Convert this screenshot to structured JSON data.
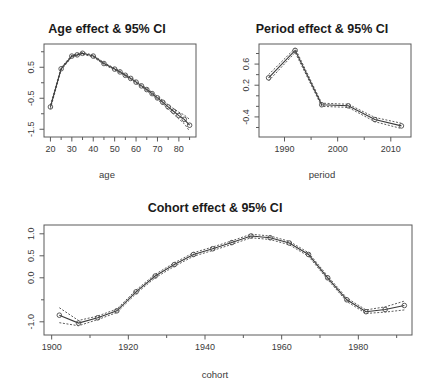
{
  "chart_data": [
    {
      "id": "age",
      "type": "line",
      "title": "Age effect & 95% CI",
      "xlabel": "age",
      "ylabel": "",
      "xlim": [
        17,
        88
      ],
      "ylim": [
        -1.75,
        1.25
      ],
      "xticks": [
        20,
        30,
        40,
        50,
        60,
        70,
        80
      ],
      "xticklabels": [
        "20",
        "30",
        "40",
        "50",
        "60",
        "70",
        "80"
      ],
      "xminorticks": [
        25,
        35,
        45,
        55,
        65,
        75,
        85
      ],
      "yticks": [
        -1.5,
        -0.5,
        0.5
      ],
      "yticklabels": [
        "-1.5",
        "-0.5",
        "0.5"
      ],
      "yminorticks": [
        -1.0,
        0.0,
        1.0
      ],
      "grid": false,
      "legend": null,
      "x": [
        20,
        25,
        30,
        32.5,
        35,
        40,
        45,
        50,
        52.5,
        55,
        57.5,
        60,
        62.5,
        65,
        67.5,
        70,
        72.5,
        75,
        77.5,
        80,
        82.5,
        85
      ],
      "series": [
        {
          "name": "estimate",
          "values": [
            -0.78,
            0.45,
            0.86,
            0.9,
            0.95,
            0.86,
            0.62,
            0.44,
            0.35,
            0.24,
            0.14,
            0.02,
            -0.1,
            -0.22,
            -0.35,
            -0.49,
            -0.63,
            -0.78,
            -0.92,
            -1.06,
            -1.18,
            -1.37
          ]
        },
        {
          "name": "ci_lower",
          "values": [
            -0.84,
            0.41,
            0.83,
            0.87,
            0.92,
            0.83,
            0.59,
            0.41,
            0.32,
            0.21,
            0.11,
            -0.01,
            -0.13,
            -0.26,
            -0.39,
            -0.54,
            -0.69,
            -0.85,
            -1.01,
            -1.17,
            -1.32,
            -1.56
          ]
        },
        {
          "name": "ci_upper",
          "values": [
            -0.72,
            0.49,
            0.89,
            0.93,
            0.98,
            0.89,
            0.65,
            0.47,
            0.38,
            0.27,
            0.17,
            0.05,
            -0.07,
            -0.18,
            -0.31,
            -0.44,
            -0.57,
            -0.71,
            -0.83,
            -0.95,
            -1.04,
            -1.18
          ]
        }
      ]
    },
    {
      "id": "period",
      "type": "line",
      "title": "Period effect & 95% CI",
      "xlabel": "period",
      "ylabel": "",
      "xlim": [
        1985.2,
        2013.8
      ],
      "ylim": [
        -0.78,
        0.98
      ],
      "xticks": [
        1990,
        2000,
        2010
      ],
      "xticklabels": [
        "1990",
        "2000",
        "2010"
      ],
      "xminorticks": [
        1995,
        2005
      ],
      "yticks": [
        -0.4,
        0.2,
        0.6
      ],
      "yticklabels": [
        "-0.4",
        "0.2",
        "0.6"
      ],
      "yminorticks": [
        -0.6,
        -0.2,
        0.0,
        0.4,
        0.8
      ],
      "grid": false,
      "legend": null,
      "x": [
        1987,
        1992,
        1997,
        2002,
        2007,
        2012
      ],
      "series": [
        {
          "name": "estimate",
          "values": [
            0.34,
            0.86,
            -0.17,
            -0.19,
            -0.45,
            -0.57
          ]
        },
        {
          "name": "ci_lower",
          "values": [
            0.28,
            0.82,
            -0.2,
            -0.22,
            -0.49,
            -0.62
          ]
        },
        {
          "name": "ci_upper",
          "values": [
            0.4,
            0.9,
            -0.14,
            -0.16,
            -0.41,
            -0.52
          ]
        }
      ]
    },
    {
      "id": "cohort",
      "type": "line",
      "title": "Cohort effect & 95% CI",
      "xlabel": "cohort",
      "ylabel": "",
      "xlim": [
        1898,
        1994
      ],
      "ylim": [
        -1.3,
        1.2
      ],
      "xticks": [
        1900,
        1920,
        1940,
        1960,
        1980
      ],
      "xticklabels": [
        "1900",
        "1920",
        "1940",
        "1960",
        "1980"
      ],
      "xminorticks": [
        1910,
        1930,
        1950,
        1970,
        1990
      ],
      "yticks": [
        -1.0,
        0.0,
        0.5,
        1.0
      ],
      "yticklabels": [
        "-1.0",
        "0.0",
        "0.5",
        "1.0"
      ],
      "yminorticks": [
        -0.5
      ],
      "grid": false,
      "legend": null,
      "x": [
        1902,
        1907,
        1912,
        1917,
        1922,
        1927,
        1932,
        1937,
        1942,
        1947,
        1952,
        1957,
        1962,
        1967,
        1972,
        1977,
        1982,
        1987,
        1992
      ],
      "series": [
        {
          "name": "estimate",
          "values": [
            -0.85,
            -1.03,
            -0.91,
            -0.75,
            -0.32,
            0.04,
            0.3,
            0.53,
            0.66,
            0.8,
            0.95,
            0.91,
            0.79,
            0.53,
            0.0,
            -0.5,
            -0.77,
            -0.72,
            -0.63
          ]
        },
        {
          "name": "ci_lower",
          "values": [
            -1.02,
            -1.09,
            -0.95,
            -0.79,
            -0.36,
            0.0,
            0.26,
            0.49,
            0.62,
            0.76,
            0.91,
            0.87,
            0.75,
            0.49,
            -0.04,
            -0.54,
            -0.81,
            -0.78,
            -0.73
          ]
        },
        {
          "name": "ci_upper",
          "values": [
            -0.68,
            -0.97,
            -0.87,
            -0.71,
            -0.28,
            0.08,
            0.34,
            0.57,
            0.7,
            0.84,
            0.99,
            0.95,
            0.83,
            0.57,
            0.04,
            -0.46,
            -0.73,
            -0.66,
            -0.53
          ]
        }
      ]
    }
  ],
  "panels": {
    "age": {
      "title": "Age effect & 95% CI",
      "xlabel": "age"
    },
    "period": {
      "title": "Period effect & 95% CI",
      "xlabel": "period"
    },
    "cohort": {
      "title": "Cohort effect & 95% CI",
      "xlabel": "cohort"
    }
  },
  "style": {
    "line_color": "#3a3a3a",
    "ci_color": "#4a4a4a",
    "axis_color": "#5a5a5a",
    "title_color": "#1a1a1a",
    "background": "#ffffff"
  }
}
